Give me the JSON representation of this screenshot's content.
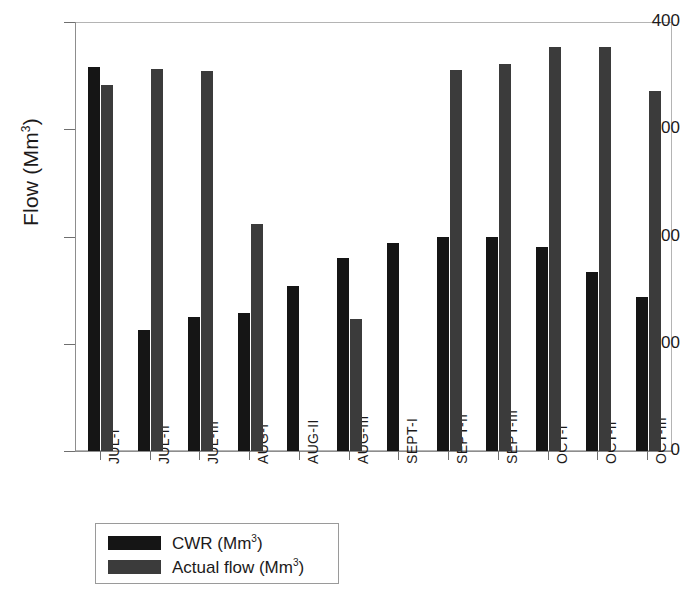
{
  "chart_data": {
    "type": "bar",
    "title": "",
    "xlabel": "",
    "ylabel": "Flow (Mm3)",
    "ylabel_base": "Flow (Mm",
    "ylabel_sup": "3",
    "ylabel_tail": ")",
    "ylim": [
      0,
      400
    ],
    "ytick_values": [
      0,
      100,
      200,
      300,
      400
    ],
    "ytick_labels": [
      "0",
      "100",
      "200",
      "300",
      "400"
    ],
    "grid": false,
    "legend_position": "below-axes",
    "categories": [
      "JUL-I",
      "JUL-II",
      "JUL-III",
      "AUG-I",
      "AUG-II",
      "AUG-III",
      "SEPT-I",
      "SEPT-II",
      "SEPT-III",
      "OCT-I",
      "OCT-II",
      "OCT-III"
    ],
    "series": [
      {
        "name": "CWR (Mm3)",
        "name_base": "CWR (Mm",
        "name_sup": "3",
        "name_tail": ")",
        "color": "#151515",
        "values": [
          358,
          113,
          125,
          129,
          154,
          180,
          194,
          200,
          200,
          190,
          167,
          144
        ]
      },
      {
        "name": "Actual flow (Mm3)",
        "name_base": "Actual flow (Mm",
        "name_sup": "3",
        "name_tail": ")",
        "color": "#3b3b3b",
        "values": [
          341,
          356,
          354,
          212,
          0,
          123,
          0,
          355,
          361,
          377,
          377,
          336
        ]
      }
    ]
  },
  "colors": {
    "cwr": "#151515",
    "actual": "#3b3b3b",
    "axis": "#8d8d8d",
    "frame": "#b4b4b4",
    "text": "#1c1a1a",
    "background": "#ffffff"
  }
}
